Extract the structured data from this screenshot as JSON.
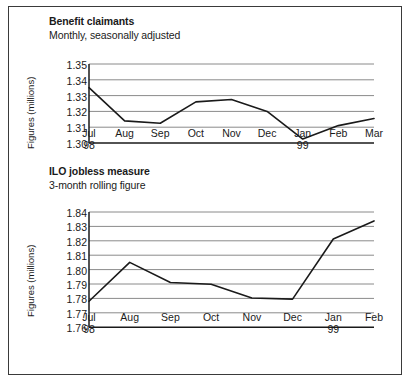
{
  "figure": {
    "background": "#ffffff",
    "border_color": "#3a3a3a",
    "line_color": "#1a1a1a",
    "grid_color": "#8a8a8a",
    "axis_color": "#1a1a1a"
  },
  "chart_data": [
    {
      "type": "line",
      "id": "benefit-claimants",
      "title": "Benefit claimants",
      "subtitle": "Monthly, seasonally adjusted",
      "ylabel": "Figures (millions)",
      "xlabel": "",
      "categories": [
        "Jul",
        "Aug",
        "Sep",
        "Oct",
        "Nov",
        "Dec",
        "Jan",
        "Feb",
        "Mar"
      ],
      "year_labels": [
        "98",
        "",
        "",
        "",
        "",
        "",
        "99",
        "",
        ""
      ],
      "values": [
        1.335,
        1.314,
        1.3125,
        1.326,
        1.3275,
        1.32,
        1.3025,
        1.311,
        1.3155
      ],
      "yticks": [
        "1.35",
        "1.34",
        "1.33",
        "1.32",
        "1.31",
        "1.30"
      ],
      "ylim": [
        1.3,
        1.35
      ],
      "grid": true,
      "legend": "none"
    },
    {
      "type": "line",
      "id": "ilo-jobless-measure",
      "title": "ILO jobless measure",
      "subtitle": "3-month rolling figure",
      "ylabel": "Figures (millions)",
      "xlabel": "",
      "categories": [
        "Jul",
        "Aug",
        "Sep",
        "Oct",
        "Nov",
        "Dec",
        "Jan",
        "Feb"
      ],
      "year_labels": [
        "98",
        "",
        "",
        "",
        "",
        "",
        "99",
        ""
      ],
      "values": [
        1.778,
        1.805,
        1.791,
        1.7898,
        1.7803,
        1.7795,
        1.8212,
        1.8338
      ],
      "yticks": [
        "1.84",
        "1.83",
        "1.82",
        "1.81",
        "1.80",
        "1.79",
        "1.78",
        "1.77",
        "1.76"
      ],
      "ylim": [
        1.76,
        1.84
      ],
      "grid": true,
      "legend": "none"
    }
  ]
}
